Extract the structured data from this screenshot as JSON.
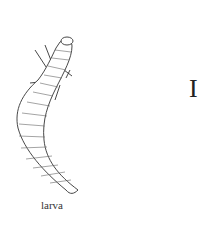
{
  "illustration": {
    "subject": "beetle adult and larva line drawing",
    "larva_caption": "larva",
    "plate_label": "I",
    "colors": {
      "ink": "#222222",
      "background": "#ffffff"
    }
  }
}
